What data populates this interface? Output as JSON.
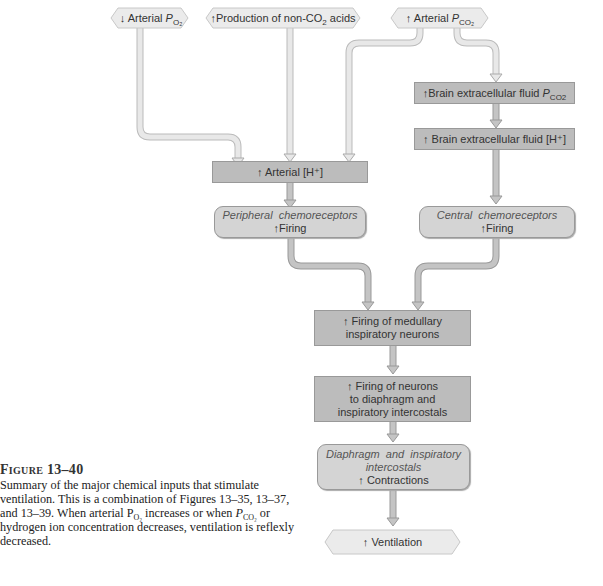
{
  "diagram": {
    "inputs": [
      {
        "id": "low-po2",
        "arrow": "↓",
        "label": "Arterial ",
        "sym": "P",
        "sub": "O₂"
      },
      {
        "id": "acids",
        "arrow": "↑",
        "label": "Production of non-CO",
        "sub2": "2",
        "label2": " acids"
      },
      {
        "id": "high-pco2",
        "arrow": "↑",
        "label": "Arterial ",
        "sym": "P",
        "sub": "CO₂"
      }
    ],
    "arterial_h": {
      "arrow": "↑",
      "label": "Arterial [H⁺]"
    },
    "brain_pco2": {
      "arrow": "↑",
      "label": "Brain extracellular fluid ",
      "sym": "P",
      "sub": "CO2"
    },
    "brain_h": {
      "arrow": "↑",
      "label": "Brain extracellular fluid [H⁺]"
    },
    "peripheral": {
      "title": "Peripheral  chemoreceptors",
      "arrow": "↑",
      "label": "Firing"
    },
    "central": {
      "title": "Central  chemoreceptors",
      "arrow": "↑",
      "label": "Firing"
    },
    "medullary": {
      "arrow": "↑",
      "line1": "Firing of medullary",
      "line2": "inspiratory neurons"
    },
    "neurons": {
      "arrow": "↑",
      "line1": " Firing of neurons",
      "line2": "to diaphragm and",
      "line3": "inspiratory intercostals"
    },
    "muscles": {
      "title1": "Diaphragm  and  inspiratory",
      "title2": "intercostals",
      "arrow": "↑",
      "label": "Contractions"
    },
    "output": {
      "arrow": "↑",
      "label": "Ventilation"
    }
  },
  "caption": {
    "title": "Figure 13–40",
    "body": "Summary of the major chemical inputs that stimulate ventilation. This is a combination of Figures 13–35, 13–37, and 13–39. When arterial P",
    "sub1": "O₂",
    "body2": " increases or when ",
    "p2": "P",
    "sub2": "CO₂",
    "body3": " or hydrogen ion concentration decreases, ventilation is reflexly decreased."
  },
  "colors": {
    "box_dark": "#bcbcbc",
    "box_round": "#d4d4d4",
    "hex_fill": "#ebebeb",
    "arrow_light": "#e2e2e2",
    "arrow_dark": "#b5b5b5"
  }
}
